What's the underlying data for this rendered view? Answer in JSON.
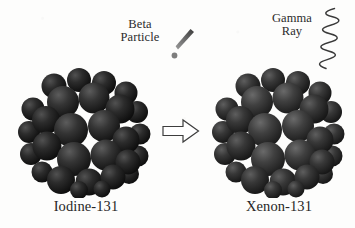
{
  "figure": {
    "background_color": "#fdfdfc",
    "ink_color": "#2b2b2b"
  },
  "emissions": [
    {
      "id": "beta",
      "name": "beta-particle",
      "line1": "Beta",
      "line2": "Particle",
      "glyph": "beta-streak-and-dot",
      "color": "#6e6e6e"
    },
    {
      "id": "gamma",
      "name": "gamma-ray",
      "line1": "Gamma",
      "line2": "Ray",
      "glyph": "zigzag-wave",
      "color": "#3a3a3a"
    }
  ],
  "nuclides": [
    {
      "id": "parent",
      "label": "Iodine-131",
      "role": "reactant",
      "sphere_color": "#1f1f1f",
      "sphere_highlight": "#474747"
    },
    {
      "id": "daughter",
      "label": "Xenon-131",
      "role": "product",
      "sphere_color": "#2a2a2a",
      "sphere_highlight": "#565656"
    }
  ],
  "reaction_arrow": {
    "name": "decay-arrow",
    "direction": "right",
    "style": "hollow-block-outline",
    "outline_color": "#3d3d3d",
    "fill_color": "#ffffff"
  }
}
